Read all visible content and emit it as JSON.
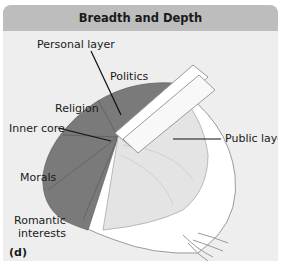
{
  "figure": {
    "title": "Breadth and Depth",
    "sublabel": "(d)",
    "labels": {
      "personal_layer": "Personal layer",
      "politics": "Politics",
      "religion": "Religion",
      "inner_core": "Inner core",
      "public_layer": "Public layer",
      "morals": "Morals",
      "romantic_line1": "Romantic",
      "romantic_line2": "interests"
    },
    "colors": {
      "header_bg": "#bdbdbd",
      "panel_bg": "#eeeeee",
      "inner_shade": "#7a7a7a",
      "onion_outline": "#999999"
    }
  }
}
